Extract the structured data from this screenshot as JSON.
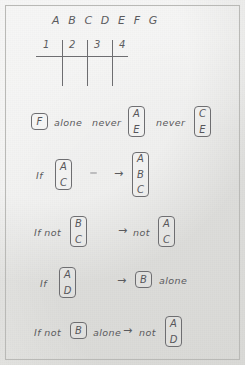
{
  "page": {
    "background_color": "#e6e6e4",
    "ink_color": "#57575a",
    "border_color": "#b9b9b6"
  },
  "header": {
    "letters": "A B C D E F G"
  },
  "grid": {
    "columns": [
      "1",
      "2",
      "3",
      "4"
    ],
    "divider_count": 3
  },
  "rules": [
    {
      "id": "rule-1",
      "parts": [
        {
          "kind": "box",
          "letters": [
            "F"
          ]
        },
        {
          "kind": "word",
          "text": "alone"
        },
        {
          "kind": "word",
          "text": "never"
        },
        {
          "kind": "box",
          "letters": [
            "A",
            "E"
          ]
        },
        {
          "kind": "word",
          "text": "never"
        },
        {
          "kind": "box",
          "letters": [
            "C",
            "E"
          ]
        }
      ]
    },
    {
      "id": "rule-2",
      "parts": [
        {
          "kind": "word",
          "text": "If"
        },
        {
          "kind": "box",
          "letters": [
            "A",
            "C"
          ]
        },
        {
          "kind": "mark",
          "text": "-"
        },
        {
          "kind": "arrow",
          "text": "→"
        },
        {
          "kind": "box",
          "letters": [
            "A",
            "B",
            "C"
          ]
        }
      ]
    },
    {
      "id": "rule-3",
      "parts": [
        {
          "kind": "word",
          "text": "If not"
        },
        {
          "kind": "box",
          "letters": [
            "B",
            "C"
          ]
        },
        {
          "kind": "arrow",
          "text": "→"
        },
        {
          "kind": "word",
          "text": "not"
        },
        {
          "kind": "box",
          "letters": [
            "A",
            "C"
          ]
        }
      ]
    },
    {
      "id": "rule-4",
      "parts": [
        {
          "kind": "word",
          "text": "If"
        },
        {
          "kind": "box",
          "letters": [
            "A",
            "D"
          ]
        },
        {
          "kind": "arrow",
          "text": "→"
        },
        {
          "kind": "box",
          "letters": [
            "B"
          ]
        },
        {
          "kind": "word",
          "text": "alone"
        }
      ]
    },
    {
      "id": "rule-5",
      "parts": [
        {
          "kind": "word",
          "text": "If not"
        },
        {
          "kind": "box",
          "letters": [
            "B"
          ]
        },
        {
          "kind": "word",
          "text": "alone"
        },
        {
          "kind": "arrow",
          "text": "→"
        },
        {
          "kind": "word",
          "text": "not"
        },
        {
          "kind": "box",
          "letters": [
            "A",
            "D"
          ]
        }
      ]
    }
  ],
  "labels": {
    "rule1_box1": "F",
    "rule1_alone": "alone",
    "rule1_never1": "never",
    "rule1_box2_l1": "A",
    "rule1_box2_l2": "E",
    "rule1_never2": "never",
    "rule1_box3_l1": "C",
    "rule1_box3_l2": "E",
    "rule2_if": "If",
    "rule2_box1_l1": "A",
    "rule2_box1_l2": "C",
    "rule2_arrow": "→",
    "rule2_box2_l1": "A",
    "rule2_box2_l2": "B",
    "rule2_box2_l3": "C",
    "rule3_ifnot": "If not",
    "rule3_box1_l1": "B",
    "rule3_box1_l2": "C",
    "rule3_arrow": "→",
    "rule3_not": "not",
    "rule3_box2_l1": "A",
    "rule3_box2_l2": "C",
    "rule4_if": "If",
    "rule4_box1_l1": "A",
    "rule4_box1_l2": "D",
    "rule4_arrow": "→",
    "rule4_box2_l1": "B",
    "rule4_alone": "alone",
    "rule5_ifnot": "If not",
    "rule5_box1_l1": "B",
    "rule5_alone": "alone",
    "rule5_arrow": "→",
    "rule5_not": "not",
    "rule5_box2_l1": "A",
    "rule5_box2_l2": "D",
    "col1": "1",
    "col2": "2",
    "col3": "3",
    "col4": "4"
  }
}
